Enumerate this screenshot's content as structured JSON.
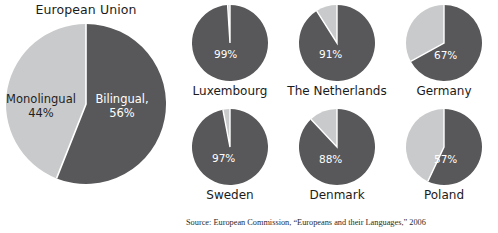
{
  "colors": {
    "dark": "#58585a",
    "light": "#c9cacb",
    "divider": "#ffffff",
    "text": "#1b1b1b",
    "text_on_dark": "#ffffff"
  },
  "eu": {
    "title": "European Union",
    "slices": [
      {
        "label": "Bilingual,",
        "value_label": "56%",
        "value": 56,
        "color_key": "dark"
      },
      {
        "label": "Monolingual",
        "value_label": "44%",
        "value": 44,
        "color_key": "light"
      }
    ]
  },
  "countries": [
    {
      "name": "Luxembourg",
      "value_label": "99%",
      "value": 99
    },
    {
      "name": "The Netherlands",
      "value_label": "91%",
      "value": 91
    },
    {
      "name": "Germany",
      "value_label": "67%",
      "value": 67
    },
    {
      "name": "Sweden",
      "value_label": "97%",
      "value": 97
    },
    {
      "name": "Denmark",
      "value_label": "88%",
      "value": 88
    },
    {
      "name": "Poland",
      "value_label": "57%",
      "value": 57
    }
  ],
  "source": "Source: European Commission, “Europeans and their Languages,” 2006",
  "chart_data": {
    "type": "pie",
    "title": "European Union",
    "unit": "percent",
    "legend_position": "in-slice",
    "charts": [
      {
        "name": "European Union",
        "labels": [
          "Bilingual,",
          "Monolingual"
        ],
        "values": [
          56,
          44
        ],
        "value_labels": [
          "56%",
          "44%"
        ]
      },
      {
        "name": "Luxembourg",
        "labels": [
          "Bilingual",
          "Monolingual"
        ],
        "values": [
          99,
          1
        ],
        "value_labels": [
          "99%",
          ""
        ]
      },
      {
        "name": "The Netherlands",
        "labels": [
          "Bilingual",
          "Monolingual"
        ],
        "values": [
          91,
          9
        ],
        "value_labels": [
          "91%",
          ""
        ]
      },
      {
        "name": "Germany",
        "labels": [
          "Bilingual",
          "Monolingual"
        ],
        "values": [
          67,
          33
        ],
        "value_labels": [
          "67%",
          ""
        ]
      },
      {
        "name": "Sweden",
        "labels": [
          "Bilingual",
          "Monolingual"
        ],
        "values": [
          97,
          3
        ],
        "value_labels": [
          "97%",
          ""
        ]
      },
      {
        "name": "Denmark",
        "labels": [
          "Bilingual",
          "Monolingual"
        ],
        "values": [
          88,
          12
        ],
        "value_labels": [
          "88%",
          ""
        ]
      },
      {
        "name": "Poland",
        "labels": [
          "Bilingual",
          "Monolingual"
        ],
        "values": [
          57,
          43
        ],
        "value_labels": [
          "57%",
          ""
        ]
      }
    ],
    "annotations": [
      "Source: European Commission, “Europeans and their Languages,” 2006"
    ]
  }
}
